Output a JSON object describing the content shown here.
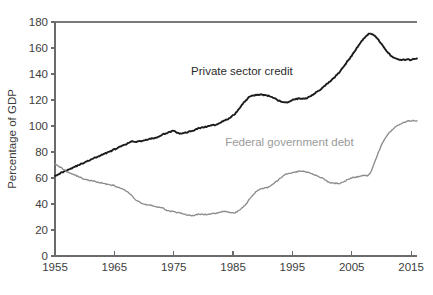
{
  "chart_data": {
    "type": "line",
    "title": "",
    "subtitle": "",
    "xlabel": "",
    "ylabel": "Percentage of GDP",
    "xlim": [
      1955,
      2016
    ],
    "ylim": [
      0,
      180
    ],
    "grid": false,
    "legend_position": "inline-annotations",
    "xticks": [
      1955,
      1965,
      1975,
      1985,
      1995,
      2005,
      2015
    ],
    "xtick_labels": [
      "1955",
      "1965",
      "1975",
      "1985",
      "1995",
      "2005",
      "2015"
    ],
    "yticks": [
      0,
      20,
      40,
      60,
      80,
      100,
      120,
      140,
      160,
      180
    ],
    "ytick_labels": [
      "0",
      "20",
      "40",
      "60",
      "80",
      "100",
      "120",
      "140",
      "160",
      "180"
    ],
    "annotations": [
      {
        "name": "private-sector-credit-label",
        "text": "Private sector credit",
        "x": 1986.5,
        "y": 139,
        "color": "#2b2b2b"
      },
      {
        "name": "federal-government-debt-label",
        "text": "Federal government debt",
        "x": 1994.5,
        "y": 85,
        "color": "#9a9a9a"
      }
    ],
    "series": [
      {
        "name": "Private sector credit",
        "color": "#1c1c1c",
        "x": [
          1955,
          1956,
          1957,
          1958,
          1959,
          1960,
          1961,
          1962,
          1963,
          1964,
          1965,
          1966,
          1967,
          1968,
          1969,
          1970,
          1971,
          1972,
          1973,
          1974,
          1975,
          1976,
          1977,
          1978,
          1979,
          1980,
          1981,
          1982,
          1983,
          1984,
          1985,
          1986,
          1987,
          1988,
          1989,
          1990,
          1991,
          1992,
          1993,
          1994,
          1995,
          1996,
          1997,
          1998,
          1999,
          2000,
          2001,
          2002,
          2003,
          2004,
          2005,
          2006,
          2007,
          2008,
          2009,
          2010,
          2011,
          2012,
          2013,
          2014,
          2015,
          2016
        ],
        "values": [
          62,
          64,
          66,
          68,
          70,
          72,
          74,
          76,
          78,
          80,
          82,
          84,
          86,
          88,
          88,
          89,
          90,
          91,
          93,
          95,
          96,
          94,
          95,
          96,
          98,
          99,
          100,
          101,
          103,
          105,
          108,
          113,
          119,
          123,
          124,
          124,
          123,
          121,
          119,
          118,
          120,
          121,
          121,
          123,
          126,
          129,
          133,
          137,
          142,
          148,
          154,
          161,
          167,
          171,
          169,
          163,
          157,
          153,
          151,
          151,
          151,
          152
        ]
      },
      {
        "name": "Federal government debt",
        "color": "#8c8c8c",
        "x": [
          1955,
          1956,
          1957,
          1958,
          1959,
          1960,
          1961,
          1962,
          1963,
          1964,
          1965,
          1966,
          1967,
          1968,
          1969,
          1970,
          1971,
          1972,
          1973,
          1974,
          1975,
          1976,
          1977,
          1978,
          1979,
          1980,
          1981,
          1982,
          1983,
          1984,
          1985,
          1986,
          1987,
          1988,
          1989,
          1990,
          1991,
          1992,
          1993,
          1994,
          1995,
          1996,
          1997,
          1998,
          1999,
          2000,
          2001,
          2002,
          2003,
          2004,
          2005,
          2006,
          2007,
          2008,
          2009,
          2010,
          2011,
          2012,
          2013,
          2014,
          2015,
          2016
        ],
        "values": [
          71,
          68,
          65,
          63,
          61,
          59,
          58,
          57,
          56,
          55,
          54,
          52,
          50,
          46,
          42,
          40,
          39,
          38,
          37,
          35,
          34,
          33,
          32,
          31,
          32,
          32,
          32,
          33,
          34,
          34,
          33,
          35,
          39,
          45,
          50,
          52,
          53,
          56,
          60,
          63,
          64,
          65,
          65,
          64,
          62,
          60,
          57,
          56,
          56,
          58,
          60,
          61,
          62,
          63,
          74,
          85,
          93,
          98,
          101,
          103,
          104,
          104
        ]
      }
    ]
  }
}
